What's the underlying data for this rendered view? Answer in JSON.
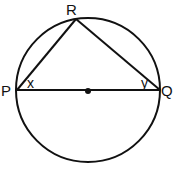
{
  "diagram": {
    "points": {
      "P": "P",
      "Q": "Q",
      "R": "R"
    },
    "angles": {
      "at_P": "x",
      "at_Q": "y"
    },
    "colors": {
      "stroke": "#111111",
      "background": "#ffffff"
    }
  }
}
